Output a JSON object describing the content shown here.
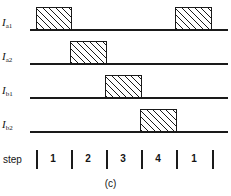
{
  "figure": {
    "caption": "(c)",
    "step_axis_label": "step",
    "line_color": "#1a1a1a",
    "hatch_color": "#1a1a1a",
    "background": "#ffffff"
  },
  "chart_data": {
    "type": "timing-diagram",
    "title": "",
    "xlabel": "step",
    "ylabel": "",
    "grid": false,
    "legend": "none",
    "x_axis_unit": "step",
    "step_boundaries_px": [
      36,
      71,
      106,
      141,
      176,
      212
    ],
    "steps": [
      {
        "label": "1",
        "start_px": 36,
        "end_px": 71,
        "center_px": 53
      },
      {
        "label": "2",
        "start_px": 71,
        "end_px": 106,
        "center_px": 88
      },
      {
        "label": "3",
        "start_px": 106,
        "end_px": 141,
        "center_px": 123
      },
      {
        "label": "4",
        "start_px": 141,
        "end_px": 176,
        "center_px": 158
      },
      {
        "label": "1",
        "start_px": 176,
        "end_px": 212,
        "center_px": 194
      }
    ],
    "signals": [
      {
        "name": "I_a1",
        "label_main": "I",
        "label_sub": "a1",
        "baseline_y_px": 29,
        "line_start_px": 30,
        "line_end_px": 228,
        "pulse_height_px": 23,
        "high_steps": [
          "1",
          "1 (repeat)"
        ],
        "pulses": [
          {
            "start_px": 36,
            "end_px": 72,
            "step": "1"
          },
          {
            "start_px": 175,
            "end_px": 212,
            "step": "1"
          }
        ],
        "values": [
          1,
          0,
          0,
          0,
          1
        ]
      },
      {
        "name": "I_a2",
        "label_main": "I",
        "label_sub": "a2",
        "baseline_y_px": 63,
        "line_start_px": 30,
        "line_end_px": 228,
        "pulse_height_px": 23,
        "high_steps": [
          "2"
        ],
        "pulses": [
          {
            "start_px": 70,
            "end_px": 107,
            "step": "2"
          }
        ],
        "values": [
          0,
          1,
          0,
          0,
          0
        ]
      },
      {
        "name": "I_b1",
        "label_main": "I",
        "label_sub": "b1",
        "baseline_y_px": 97,
        "line_start_px": 30,
        "line_end_px": 228,
        "pulse_height_px": 23,
        "high_steps": [
          "3"
        ],
        "pulses": [
          {
            "start_px": 105,
            "end_px": 142,
            "step": "3"
          }
        ],
        "values": [
          0,
          0,
          1,
          0,
          0
        ]
      },
      {
        "name": "I_b2",
        "label_main": "I",
        "label_sub": "b2",
        "baseline_y_px": 131,
        "line_start_px": 30,
        "line_end_px": 228,
        "pulse_height_px": 23,
        "high_steps": [
          "4"
        ],
        "pulses": [
          {
            "start_px": 140,
            "end_px": 177,
            "step": "4"
          }
        ],
        "values": [
          0,
          0,
          0,
          1,
          0
        ]
      }
    ]
  }
}
